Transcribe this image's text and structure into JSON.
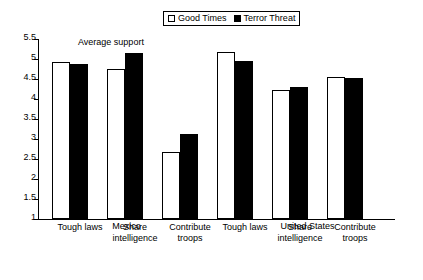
{
  "chart_data": {
    "type": "bar",
    "title": "",
    "axis_note": "Average support",
    "xlabel": "",
    "ylabel": "",
    "ylim": [
      1,
      5.5
    ],
    "ytick_step": 0.5,
    "yticks": [
      "1",
      "1.5",
      "2",
      "2.5",
      "3",
      "3.5",
      "4",
      "4.5",
      "5",
      "5.5"
    ],
    "ytick_values": [
      1,
      1.5,
      2,
      2.5,
      3,
      3.5,
      4,
      4.5,
      5,
      5.5
    ],
    "grid": false,
    "legend_position": "top-center",
    "categories": [
      "Tough laws",
      "Share\nintelligence",
      "Contribute\ntroops",
      "Tough laws",
      "Share\nintelligence",
      "Contribute\ntroops"
    ],
    "groups": [
      {
        "name": "Mexico",
        "categories": [
          "Tough laws",
          "Share intelligence",
          "Contribute troops"
        ]
      },
      {
        "name": "United States",
        "categories": [
          "Tough laws",
          "Share intelligence",
          "Contribute troops"
        ]
      }
    ],
    "series": [
      {
        "name": "Good Times",
        "color": "#ffffff",
        "edge_color": "#000000",
        "values": [
          4.92,
          4.75,
          2.68,
          5.18,
          4.22,
          4.56
        ]
      },
      {
        "name": "Terror Threat",
        "color": "#000000",
        "edge_color": "#000000",
        "values": [
          4.87,
          5.15,
          3.12,
          4.95,
          4.29,
          4.52
        ]
      }
    ]
  },
  "legend": {
    "items": [
      {
        "label": "Good Times",
        "swatch": "hollow-square"
      },
      {
        "label": "Terror Threat",
        "swatch": "filled-square"
      }
    ]
  }
}
